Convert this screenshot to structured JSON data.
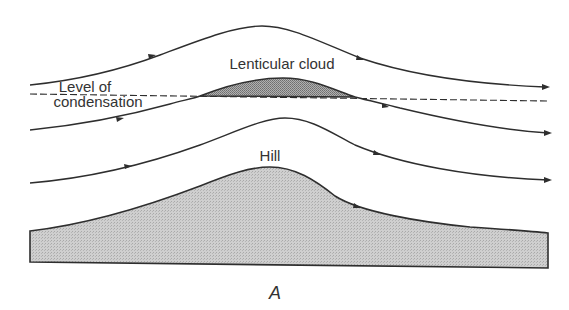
{
  "figure": {
    "panel_label": "A",
    "labels": {
      "cloud": "Lenticular cloud",
      "level_line1": "Level of",
      "level_line2": "condensation",
      "hill": "Hill"
    },
    "colors": {
      "line": "#2e2e2e",
      "fill": "#c9c9c9",
      "cloud_fill": "#9a9a9a",
      "text": "#333333",
      "background": "#ffffff"
    },
    "elements": [
      {
        "type": "streamline",
        "name": "upper airflow",
        "direction": "left-to-right"
      },
      {
        "type": "dashed-line",
        "name": "level of condensation"
      },
      {
        "type": "shaded-lens",
        "name": "lenticular cloud"
      },
      {
        "type": "streamline",
        "name": "middle airflow",
        "direction": "left-to-right"
      },
      {
        "type": "streamline",
        "name": "lower airflow",
        "direction": "left-to-right"
      },
      {
        "type": "shaded-terrain",
        "name": "hill"
      }
    ]
  }
}
